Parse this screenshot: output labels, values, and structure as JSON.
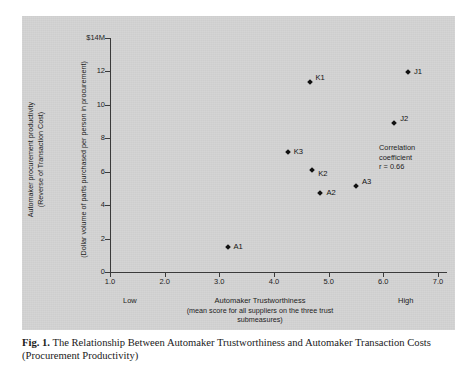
{
  "figure": {
    "caption_prefix": "Fig. 1.",
    "caption_text": "The Relationship Between Automaker Trustworthiness and Automaker Transaction Costs (Procurement Productivity)"
  },
  "annotation": {
    "line1": "Correlation",
    "line2": "coefficient",
    "line3": "r = 0.66"
  },
  "axis": {
    "y_title_line1": "Automaker procurement productivity",
    "y_title_line2": "(Reverse of Transaction Cost)",
    "y_title_line3": "(Dollar volume of parts purchased per person in procurement)",
    "x_title_line1": "Automaker Trustworthiness",
    "x_title_line2": "(mean score for all suppliers on the three trust",
    "x_title_line3": "submeasures)",
    "x_anchor_low": "Low",
    "x_anchor_high": "High"
  },
  "chart_data": {
    "type": "scatter",
    "title": "The Relationship Between Automaker Trustworthiness and Automaker Transaction Costs (Procurement Productivity)",
    "xlabel": "Automaker Trustworthiness (mean score for all suppliers on the three trust submeasures)",
    "ylabel": "Automaker procurement productivity (Reverse of Transaction Cost) (Dollar volume of parts purchased per person in procurement)",
    "xlim": [
      1.0,
      7.0
    ],
    "ylim": [
      0,
      14
    ],
    "xticks": [
      "1.0",
      "2.0",
      "3.0",
      "4.0",
      "5.0",
      "6.0",
      "7.0"
    ],
    "xtick_values": [
      1.0,
      2.0,
      3.0,
      4.0,
      5.0,
      6.0,
      7.0
    ],
    "yticks": [
      "0",
      "2",
      "4",
      "6",
      "8",
      "10",
      "12",
      "$14M"
    ],
    "ytick_values": [
      0,
      2,
      4,
      6,
      8,
      10,
      12,
      14
    ],
    "y_unit": "$M",
    "grid": false,
    "legend": false,
    "correlation_r": 0.66,
    "points": [
      {
        "label": "A1",
        "x": 3.15,
        "y": 1.5,
        "label_pos": "right"
      },
      {
        "label": "K3",
        "x": 4.25,
        "y": 7.2,
        "label_pos": "right"
      },
      {
        "label": "K1",
        "x": 4.65,
        "y": 11.35,
        "label_pos": "upper-right"
      },
      {
        "label": "K2",
        "x": 4.7,
        "y": 6.1,
        "label_pos": "lower-right"
      },
      {
        "label": "A2",
        "x": 4.85,
        "y": 4.7,
        "label_pos": "right"
      },
      {
        "label": "A3",
        "x": 5.5,
        "y": 5.15,
        "label_pos": "upper-right"
      },
      {
        "label": "J2",
        "x": 6.2,
        "y": 8.9,
        "label_pos": "upper-right"
      },
      {
        "label": "J1",
        "x": 6.45,
        "y": 11.95,
        "label_pos": "right"
      }
    ]
  },
  "colors": {
    "panel_background": "#d2d2d2",
    "axis": "#3a3a3a",
    "marker": "#111111",
    "text": "#1d1d1d",
    "page_background": "#ffffff"
  }
}
